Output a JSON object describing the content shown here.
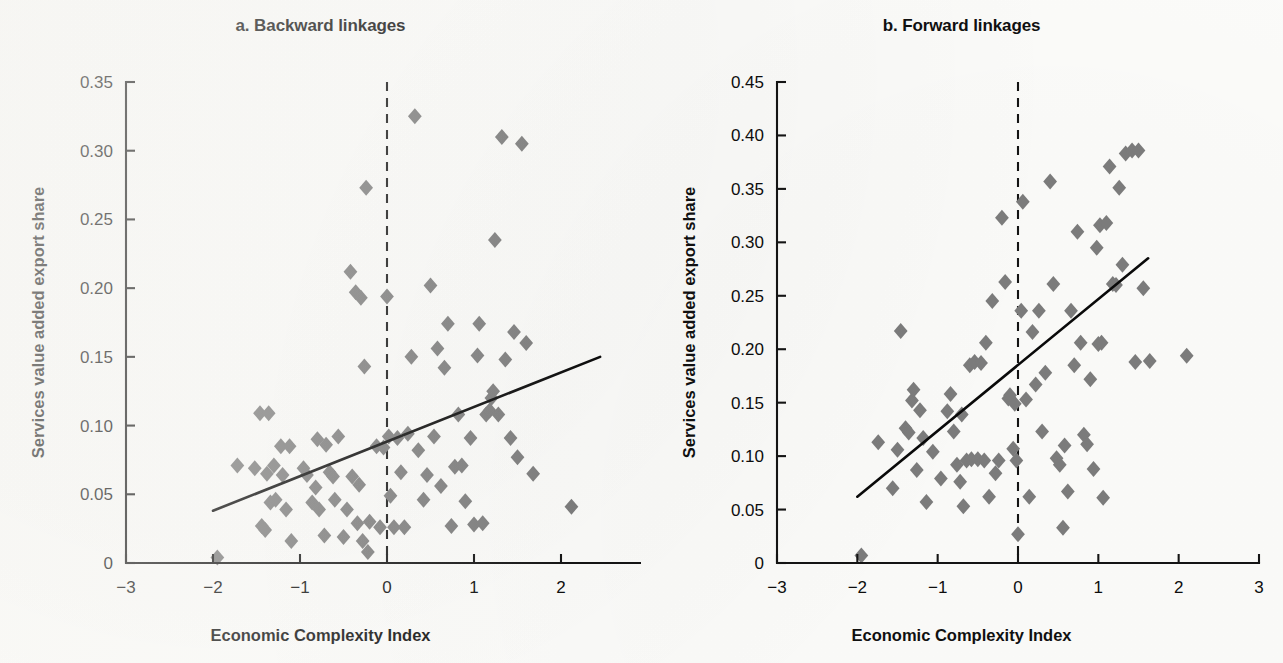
{
  "figure": {
    "background_color": "#fdfdfb",
    "marker_color": "#7d7d7d",
    "line_color": "#0a0a0a"
  },
  "panels": [
    {
      "key": "backward",
      "title": "a. Backward linkages",
      "xlabel": "Economic Complexity Index",
      "ylabel": "Services value added export share"
    },
    {
      "key": "forward",
      "title": "b. Forward linkages",
      "xlabel": "Economic Complexity Index",
      "ylabel": "Services value added export share"
    }
  ],
  "chart_data": [
    {
      "type": "scatter",
      "panel": "a",
      "title": "a. Backward linkages",
      "xlabel": "Economic Complexity Index",
      "ylabel": "Services value added export share",
      "xlim": [
        -3,
        3
      ],
      "ylim": [
        0,
        0.35
      ],
      "xticks": [
        -3,
        -2,
        -1,
        0,
        1,
        2,
        3
      ],
      "xtick_labels": [
        "−3",
        "−2",
        "−1",
        "0",
        "1",
        "2",
        "3"
      ],
      "yticks": [
        0,
        0.05,
        0.1,
        0.15,
        0.2,
        0.25,
        0.3,
        0.35
      ],
      "ytick_labels": [
        "0",
        "0.05",
        "0.10",
        "0.15",
        "0.20",
        "0.25",
        "0.30",
        "0.35"
      ],
      "grid": false,
      "legend": "none",
      "marker": "diamond",
      "reference_line": {
        "orientation": "vertical",
        "x": 0,
        "style": "dashed"
      },
      "fit_line": {
        "x": [
          -2.0,
          2.45
        ],
        "y": [
          0.038,
          0.15
        ],
        "style": "solid"
      },
      "points": [
        [
          -1.95,
          0.004
        ],
        [
          -1.72,
          0.071
        ],
        [
          -1.52,
          0.069
        ],
        [
          -1.46,
          0.109
        ],
        [
          -1.44,
          0.027
        ],
        [
          -1.4,
          0.024
        ],
        [
          -1.38,
          0.065
        ],
        [
          -1.36,
          0.109
        ],
        [
          -1.34,
          0.044
        ],
        [
          -1.3,
          0.071
        ],
        [
          -1.28,
          0.046
        ],
        [
          -1.22,
          0.085
        ],
        [
          -1.2,
          0.064
        ],
        [
          -1.16,
          0.039
        ],
        [
          -1.12,
          0.085
        ],
        [
          -1.1,
          0.016
        ],
        [
          -0.96,
          0.069
        ],
        [
          -0.92,
          0.064
        ],
        [
          -0.86,
          0.044
        ],
        [
          -0.82,
          0.055
        ],
        [
          -0.8,
          0.09
        ],
        [
          -0.78,
          0.039
        ],
        [
          -0.72,
          0.02
        ],
        [
          -0.7,
          0.086
        ],
        [
          -0.66,
          0.066
        ],
        [
          -0.62,
          0.063
        ],
        [
          -0.6,
          0.046
        ],
        [
          -0.56,
          0.092
        ],
        [
          -0.5,
          0.019
        ],
        [
          -0.46,
          0.039
        ],
        [
          -0.42,
          0.212
        ],
        [
          -0.4,
          0.063
        ],
        [
          -0.36,
          0.197
        ],
        [
          -0.34,
          0.029
        ],
        [
          -0.32,
          0.057
        ],
        [
          -0.3,
          0.193
        ],
        [
          -0.28,
          0.016
        ],
        [
          -0.26,
          0.143
        ],
        [
          -0.24,
          0.273
        ],
        [
          -0.22,
          0.008
        ],
        [
          -0.2,
          0.03
        ],
        [
          -0.12,
          0.085
        ],
        [
          -0.08,
          0.026
        ],
        [
          -0.04,
          0.084
        ],
        [
          0.0,
          0.194
        ],
        [
          0.02,
          0.092
        ],
        [
          0.04,
          0.049
        ],
        [
          0.08,
          0.026
        ],
        [
          0.12,
          0.091
        ],
        [
          0.16,
          0.066
        ],
        [
          0.2,
          0.026
        ],
        [
          0.24,
          0.094
        ],
        [
          0.28,
          0.15
        ],
        [
          0.32,
          0.325
        ],
        [
          0.36,
          0.082
        ],
        [
          0.42,
          0.046
        ],
        [
          0.46,
          0.064
        ],
        [
          0.5,
          0.202
        ],
        [
          0.54,
          0.092
        ],
        [
          0.58,
          0.156
        ],
        [
          0.62,
          0.056
        ],
        [
          0.66,
          0.142
        ],
        [
          0.7,
          0.174
        ],
        [
          0.74,
          0.027
        ],
        [
          0.78,
          0.07
        ],
        [
          0.82,
          0.108
        ],
        [
          0.86,
          0.071
        ],
        [
          0.9,
          0.045
        ],
        [
          0.96,
          0.091
        ],
        [
          1.0,
          0.028
        ],
        [
          1.04,
          0.151
        ],
        [
          1.06,
          0.174
        ],
        [
          1.1,
          0.029
        ],
        [
          1.14,
          0.108
        ],
        [
          1.18,
          0.111
        ],
        [
          1.2,
          0.12
        ],
        [
          1.22,
          0.125
        ],
        [
          1.24,
          0.235
        ],
        [
          1.28,
          0.108
        ],
        [
          1.32,
          0.31
        ],
        [
          1.36,
          0.148
        ],
        [
          1.42,
          0.091
        ],
        [
          1.46,
          0.168
        ],
        [
          1.5,
          0.077
        ],
        [
          1.55,
          0.305
        ],
        [
          1.6,
          0.16
        ],
        [
          1.68,
          0.065
        ],
        [
          2.12,
          0.041
        ]
      ]
    },
    {
      "type": "scatter",
      "panel": "b",
      "title": "b. Forward linkages",
      "xlabel": "Economic Complexity Index",
      "ylabel": "Services value added export share",
      "xlim": [
        -3,
        3
      ],
      "ylim": [
        0,
        0.45
      ],
      "xticks": [
        -3,
        -2,
        -1,
        0,
        1,
        2,
        3
      ],
      "xtick_labels": [
        "−3",
        "−2",
        "−1",
        "0",
        "1",
        "2",
        "3"
      ],
      "yticks": [
        0,
        0.05,
        0.1,
        0.15,
        0.2,
        0.25,
        0.3,
        0.35,
        0.4,
        0.45
      ],
      "ytick_labels": [
        "0",
        "0.05",
        "0.10",
        "0.15",
        "0.20",
        "0.25",
        "0.30",
        "0.35",
        "0.40",
        "0.45"
      ],
      "grid": false,
      "legend": "none",
      "marker": "diamond",
      "reference_line": {
        "orientation": "vertical",
        "x": 0,
        "style": "dashed"
      },
      "fit_line": {
        "x": [
          -2.0,
          1.62
        ],
        "y": [
          0.062,
          0.285
        ],
        "style": "solid"
      },
      "points": [
        [
          -1.95,
          0.007
        ],
        [
          -1.74,
          0.113
        ],
        [
          -1.56,
          0.07
        ],
        [
          -1.5,
          0.106
        ],
        [
          -1.46,
          0.217
        ],
        [
          -1.4,
          0.126
        ],
        [
          -1.36,
          0.122
        ],
        [
          -1.32,
          0.152
        ],
        [
          -1.3,
          0.162
        ],
        [
          -1.26,
          0.087
        ],
        [
          -1.22,
          0.143
        ],
        [
          -1.18,
          0.117
        ],
        [
          -1.14,
          0.057
        ],
        [
          -1.06,
          0.104
        ],
        [
          -0.96,
          0.079
        ],
        [
          -0.88,
          0.142
        ],
        [
          -0.84,
          0.158
        ],
        [
          -0.8,
          0.123
        ],
        [
          -0.76,
          0.092
        ],
        [
          -0.72,
          0.076
        ],
        [
          -0.7,
          0.139
        ],
        [
          -0.68,
          0.053
        ],
        [
          -0.64,
          0.096
        ],
        [
          -0.6,
          0.185
        ],
        [
          -0.58,
          0.097
        ],
        [
          -0.54,
          0.188
        ],
        [
          -0.5,
          0.097
        ],
        [
          -0.46,
          0.187
        ],
        [
          -0.42,
          0.096
        ],
        [
          -0.4,
          0.206
        ],
        [
          -0.36,
          0.062
        ],
        [
          -0.32,
          0.245
        ],
        [
          -0.28,
          0.084
        ],
        [
          -0.24,
          0.096
        ],
        [
          -0.2,
          0.323
        ],
        [
          -0.16,
          0.263
        ],
        [
          -0.12,
          0.154
        ],
        [
          -0.1,
          0.157
        ],
        [
          -0.06,
          0.107
        ],
        [
          -0.04,
          0.149
        ],
        [
          -0.02,
          0.096
        ],
        [
          0.0,
          0.027
        ],
        [
          0.04,
          0.236
        ],
        [
          0.06,
          0.338
        ],
        [
          0.1,
          0.153
        ],
        [
          0.14,
          0.062
        ],
        [
          0.18,
          0.216
        ],
        [
          0.22,
          0.167
        ],
        [
          0.26,
          0.236
        ],
        [
          0.3,
          0.123
        ],
        [
          0.34,
          0.178
        ],
        [
          0.4,
          0.357
        ],
        [
          0.44,
          0.261
        ],
        [
          0.48,
          0.098
        ],
        [
          0.52,
          0.092
        ],
        [
          0.56,
          0.033
        ],
        [
          0.58,
          0.11
        ],
        [
          0.62,
          0.067
        ],
        [
          0.66,
          0.236
        ],
        [
          0.7,
          0.185
        ],
        [
          0.74,
          0.31
        ],
        [
          0.78,
          0.206
        ],
        [
          0.82,
          0.12
        ],
        [
          0.86,
          0.111
        ],
        [
          0.9,
          0.172
        ],
        [
          0.94,
          0.088
        ],
        [
          0.98,
          0.295
        ],
        [
          1.0,
          0.205
        ],
        [
          1.02,
          0.316
        ],
        [
          1.04,
          0.206
        ],
        [
          1.06,
          0.061
        ],
        [
          1.1,
          0.318
        ],
        [
          1.14,
          0.371
        ],
        [
          1.18,
          0.261
        ],
        [
          1.22,
          0.26
        ],
        [
          1.26,
          0.351
        ],
        [
          1.3,
          0.279
        ],
        [
          1.34,
          0.383
        ],
        [
          1.42,
          0.386
        ],
        [
          1.46,
          0.188
        ],
        [
          1.5,
          0.386
        ],
        [
          1.56,
          0.257
        ],
        [
          1.64,
          0.189
        ],
        [
          2.1,
          0.194
        ]
      ]
    }
  ]
}
